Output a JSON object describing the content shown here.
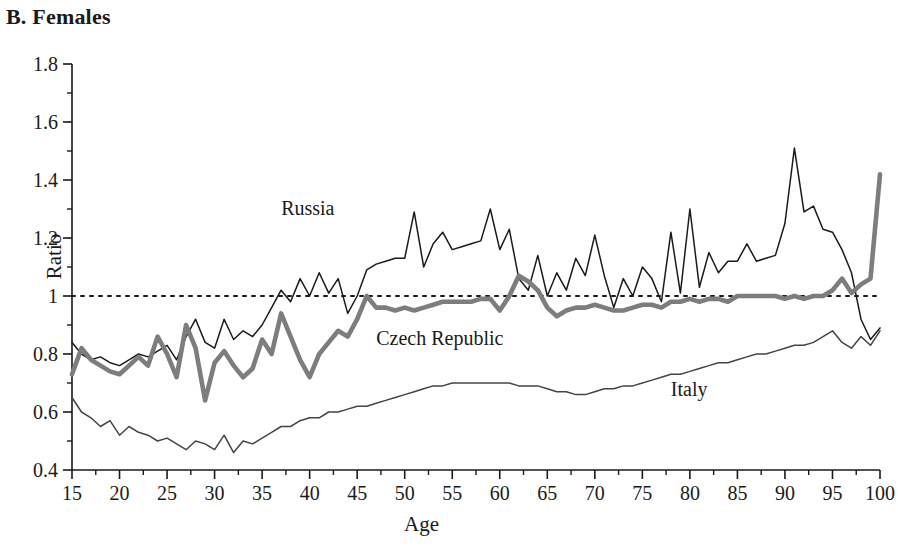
{
  "panel": {
    "title": "B. Females"
  },
  "axes": {
    "ylabel": "Ratio",
    "xlabel": "Age",
    "y_ticks": [
      "1.8",
      "1.6",
      "1.4",
      "1.2",
      "1",
      "0.8",
      "0.6",
      "0.4"
    ],
    "x_ticks": [
      "15",
      "20",
      "25",
      "30",
      "35",
      "40",
      "45",
      "50",
      "55",
      "60",
      "65",
      "70",
      "75",
      "80",
      "85",
      "90",
      "95",
      "100"
    ]
  },
  "labels": {
    "russia": "Russia",
    "czech": "Czech Republic",
    "italy": "Italy"
  },
  "colors": {
    "russia": "#1a1a1a",
    "czech": "#7d7d7d",
    "italy": "#444444",
    "reference": "#1a1a1a",
    "axis": "#1a1a1a"
  },
  "chart_data": {
    "type": "line",
    "title": "B. Females",
    "xlabel": "Age",
    "ylabel": "Ratio",
    "xlim": [
      15,
      100
    ],
    "ylim": [
      0.4,
      1.8
    ],
    "grid": false,
    "legend": "inline-annotations",
    "annotations": [
      {
        "text": "Russia",
        "x": 37,
        "y": 1.28
      },
      {
        "text": "Czech Republic",
        "x": 47,
        "y": 0.83
      },
      {
        "text": "Italy",
        "x": 78,
        "y": 0.655
      },
      {
        "text": "reference line at ratio = 1",
        "x": null,
        "y": 1.0
      }
    ],
    "reference_line": {
      "y": 1.0,
      "style": "dotted"
    },
    "x": [
      15,
      16,
      17,
      18,
      19,
      20,
      21,
      22,
      23,
      24,
      25,
      26,
      27,
      28,
      29,
      30,
      31,
      32,
      33,
      34,
      35,
      36,
      37,
      38,
      39,
      40,
      41,
      42,
      43,
      44,
      45,
      46,
      47,
      48,
      49,
      50,
      51,
      52,
      53,
      54,
      55,
      56,
      57,
      58,
      59,
      60,
      61,
      62,
      63,
      64,
      65,
      66,
      67,
      68,
      69,
      70,
      71,
      72,
      73,
      74,
      75,
      76,
      77,
      78,
      79,
      80,
      81,
      82,
      83,
      84,
      85,
      86,
      87,
      88,
      89,
      90,
      91,
      92,
      93,
      94,
      95,
      96,
      97,
      98,
      99,
      100
    ],
    "series": [
      {
        "name": "Russia",
        "color": "#1a1a1a",
        "width": "thin",
        "values": [
          0.84,
          0.8,
          0.78,
          0.79,
          0.77,
          0.76,
          0.78,
          0.8,
          0.79,
          0.81,
          0.83,
          0.78,
          0.86,
          0.92,
          0.84,
          0.82,
          0.92,
          0.85,
          0.88,
          0.86,
          0.9,
          0.96,
          1.02,
          0.98,
          1.06,
          1.0,
          1.08,
          1.01,
          1.06,
          0.94,
          1.0,
          1.09,
          1.11,
          1.12,
          1.13,
          1.13,
          1.29,
          1.1,
          1.18,
          1.22,
          1.16,
          1.17,
          1.18,
          1.19,
          1.3,
          1.16,
          1.23,
          1.06,
          1.02,
          1.14,
          1.0,
          1.08,
          1.02,
          1.13,
          1.07,
          1.21,
          1.07,
          0.96,
          1.06,
          1.0,
          1.1,
          1.06,
          0.98,
          1.22,
          1.01,
          1.3,
          1.03,
          1.15,
          1.08,
          1.12,
          1.12,
          1.18,
          1.12,
          1.13,
          1.14,
          1.25,
          1.51,
          1.29,
          1.31,
          1.23,
          1.22,
          1.16,
          1.08,
          0.92,
          0.85,
          0.89
        ]
      },
      {
        "name": "Czech Republic",
        "color": "#7d7d7d",
        "width": "thick",
        "values": [
          0.73,
          0.82,
          0.78,
          0.76,
          0.74,
          0.73,
          0.76,
          0.79,
          0.76,
          0.86,
          0.8,
          0.72,
          0.9,
          0.82,
          0.64,
          0.77,
          0.81,
          0.76,
          0.72,
          0.75,
          0.85,
          0.8,
          0.94,
          0.86,
          0.78,
          0.72,
          0.8,
          0.84,
          0.88,
          0.86,
          0.92,
          1.0,
          0.96,
          0.96,
          0.95,
          0.96,
          0.95,
          0.96,
          0.97,
          0.98,
          0.98,
          0.98,
          0.98,
          0.99,
          0.99,
          0.95,
          1.0,
          1.07,
          1.05,
          1.02,
          0.96,
          0.93,
          0.95,
          0.96,
          0.96,
          0.97,
          0.96,
          0.95,
          0.95,
          0.96,
          0.97,
          0.97,
          0.96,
          0.98,
          0.98,
          0.99,
          0.98,
          0.99,
          0.99,
          0.98,
          1.0,
          1.0,
          1.0,
          1.0,
          1.0,
          0.99,
          1.0,
          0.99,
          1.0,
          1.0,
          1.02,
          1.06,
          1.01,
          1.04,
          1.06,
          1.42
        ]
      },
      {
        "name": "Italy",
        "color": "#444444",
        "width": "thin",
        "values": [
          0.65,
          0.6,
          0.58,
          0.55,
          0.57,
          0.52,
          0.55,
          0.53,
          0.52,
          0.5,
          0.51,
          0.49,
          0.47,
          0.5,
          0.49,
          0.47,
          0.52,
          0.46,
          0.5,
          0.49,
          0.51,
          0.53,
          0.55,
          0.55,
          0.57,
          0.58,
          0.58,
          0.6,
          0.6,
          0.61,
          0.62,
          0.62,
          0.63,
          0.64,
          0.65,
          0.66,
          0.67,
          0.68,
          0.69,
          0.69,
          0.7,
          0.7,
          0.7,
          0.7,
          0.7,
          0.7,
          0.7,
          0.69,
          0.69,
          0.69,
          0.68,
          0.67,
          0.67,
          0.66,
          0.66,
          0.67,
          0.68,
          0.68,
          0.69,
          0.69,
          0.7,
          0.71,
          0.72,
          0.73,
          0.73,
          0.74,
          0.75,
          0.76,
          0.77,
          0.77,
          0.78,
          0.79,
          0.8,
          0.8,
          0.81,
          0.82,
          0.83,
          0.83,
          0.84,
          0.86,
          0.88,
          0.84,
          0.82,
          0.86,
          0.83,
          0.88
        ]
      }
    ]
  }
}
